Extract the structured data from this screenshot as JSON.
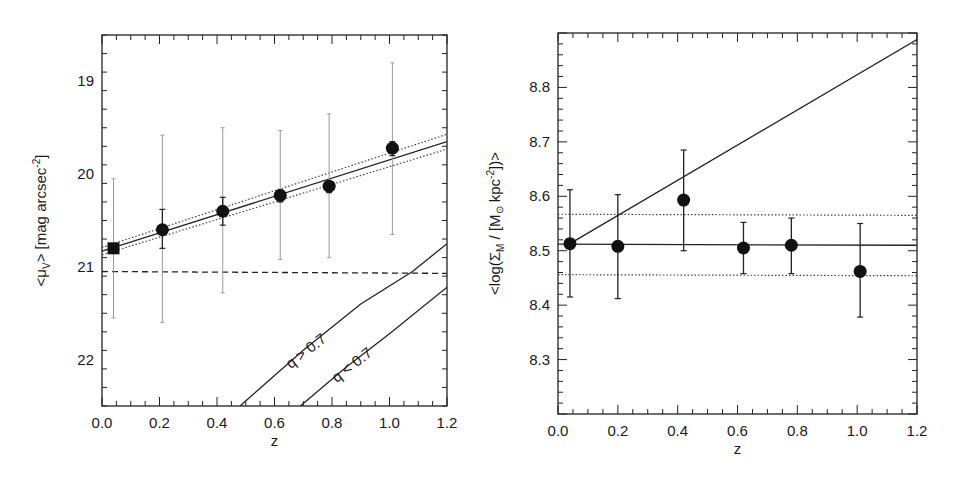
{
  "chart_data": [
    {
      "type": "scatter",
      "panel": "left",
      "title": "",
      "xlabel": "z",
      "ylabel": "<μV> [mag arcsec-2]",
      "ylabel_parts": {
        "main": "<μ",
        "sub": "V",
        "rest": "> [mag arcsec",
        "sup": "-2",
        "end": "]"
      },
      "xlim": [
        0.0,
        1.2
      ],
      "ylim": [
        22.5,
        18.5
      ],
      "y_inverted": true,
      "x_ticks": [
        "0.0",
        "0.2",
        "0.4",
        "0.6",
        "0.8",
        "1.0",
        "1.2"
      ],
      "y_ticks": [
        "19",
        "20",
        "21",
        "22"
      ],
      "grid": false,
      "series": [
        {
          "name": "data",
          "marker": "circle",
          "points": [
            {
              "z": 0.04,
              "y": 20.8,
              "marker": "square",
              "err_inner": [
                20.8,
                20.8
              ],
              "err_outer": [
                20.05,
                21.55
              ]
            },
            {
              "z": 0.21,
              "y": 20.6,
              "err_inner": [
                20.38,
                20.8
              ],
              "err_outer": [
                19.58,
                21.6
              ]
            },
            {
              "z": 0.42,
              "y": 20.4,
              "err_inner": [
                20.25,
                20.55
              ],
              "err_outer": [
                19.5,
                21.28
              ]
            },
            {
              "z": 0.62,
              "y": 20.23,
              "err_inner": [
                20.17,
                20.3
              ],
              "err_outer": [
                19.53,
                20.92
              ]
            },
            {
              "z": 0.79,
              "y": 20.13,
              "err_inner": [
                20.08,
                20.2
              ],
              "err_outer": [
                19.35,
                20.9
              ]
            },
            {
              "z": 1.01,
              "y": 19.72,
              "err_inner": [
                19.65,
                19.8
              ],
              "err_outer": [
                18.8,
                20.65
              ]
            }
          ]
        },
        {
          "name": "fit",
          "style": "solid",
          "x": [
            0.0,
            1.2
          ],
          "y": [
            20.83,
            19.65
          ]
        },
        {
          "name": "fit-upper",
          "style": "dotted",
          "x": [
            0.0,
            1.2
          ],
          "y": [
            20.79,
            19.57
          ]
        },
        {
          "name": "fit-lower",
          "style": "dotted",
          "x": [
            0.0,
            1.2
          ],
          "y": [
            20.87,
            19.73
          ]
        },
        {
          "name": "threshold",
          "style": "dashed",
          "x": [
            0.0,
            1.2
          ],
          "y": [
            21.05,
            21.07
          ]
        },
        {
          "name": "q > 0.7",
          "style": "solid",
          "x": [
            0.48,
            0.7,
            0.9,
            1.08,
            1.2
          ],
          "y": [
            22.5,
            21.9,
            21.4,
            21.05,
            20.75
          ]
        },
        {
          "name": "q < 0.7",
          "style": "solid",
          "x": [
            0.69,
            0.85,
            1.0,
            1.2
          ],
          "y": [
            22.5,
            22.08,
            21.72,
            21.22
          ]
        }
      ],
      "annotations": [
        {
          "text": "q > 0.7",
          "x": 0.72,
          "y": 21.95,
          "rotation": -38
        },
        {
          "text": "q < 0.7",
          "x": 0.88,
          "y": 22.1,
          "rotation": -38
        }
      ]
    },
    {
      "type": "scatter",
      "panel": "right",
      "title": "",
      "xlabel": "z",
      "ylabel": "<log(ΣM / [M⊙ kpc-2])>",
      "ylabel_parts": {
        "main": "<log(Σ",
        "sub": "M",
        "mid": " / [M",
        "sun": "⊙",
        "rest": " kpc",
        "sup": "-2",
        "end": "])>"
      },
      "xlim": [
        0.0,
        1.2
      ],
      "ylim": [
        8.2,
        8.9
      ],
      "x_ticks": [
        "0.0",
        "0.2",
        "0.4",
        "0.6",
        "0.8",
        "1.0",
        "1.2"
      ],
      "y_ticks": [
        "8.3",
        "8.4",
        "8.5",
        "8.6",
        "8.7",
        "8.8"
      ],
      "grid": false,
      "series": [
        {
          "name": "data",
          "marker": "circle",
          "points": [
            {
              "z": 0.04,
              "y": 8.513,
              "err": [
                8.415,
                8.612
              ]
            },
            {
              "z": 0.2,
              "y": 8.508,
              "err": [
                8.412,
                8.603
              ]
            },
            {
              "z": 0.42,
              "y": 8.593,
              "err": [
                8.5,
                8.685
              ]
            },
            {
              "z": 0.62,
              "y": 8.505,
              "err": [
                8.458,
                8.552
              ]
            },
            {
              "z": 0.78,
              "y": 8.51,
              "err": [
                8.458,
                8.56
              ]
            },
            {
              "z": 1.01,
              "y": 8.462,
              "err": [
                8.378,
                8.55
              ]
            }
          ]
        },
        {
          "name": "mean",
          "style": "solid",
          "x": [
            0.0,
            1.2
          ],
          "y": [
            8.512,
            8.51
          ]
        },
        {
          "name": "mean-upper",
          "style": "dotted",
          "x": [
            0.0,
            1.2
          ],
          "y": [
            8.567,
            8.565
          ]
        },
        {
          "name": "mean-lower",
          "style": "dotted",
          "x": [
            0.0,
            1.2
          ],
          "y": [
            8.456,
            8.454
          ]
        },
        {
          "name": "prediction",
          "style": "solid",
          "x": [
            0.04,
            1.2
          ],
          "y": [
            8.513,
            8.888
          ]
        }
      ]
    }
  ]
}
